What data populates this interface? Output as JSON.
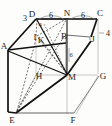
{
  "figure": {
    "kind": "3d-rectangular-prism-geometry-diagram",
    "stroke_colors": {
      "bold": "#111111",
      "thin": "#5a5a5a",
      "light": "#a8a8a8",
      "dashed": "#3a3a3a"
    },
    "background": "#fdfdfb"
  },
  "vertices": [
    {
      "name": "A",
      "label": "A",
      "x": 6,
      "y": 46
    },
    {
      "name": "B",
      "label": "B",
      "x": 65,
      "y": 37
    },
    {
      "name": "C",
      "label": "C",
      "x": 98,
      "y": 15
    },
    {
      "name": "D",
      "label": "D",
      "x": 35,
      "y": 15
    },
    {
      "name": "E",
      "label": "E",
      "x": 14,
      "y": 116
    },
    {
      "name": "F",
      "label": "F",
      "x": 74,
      "y": 116
    },
    {
      "name": "G",
      "label": "G",
      "x": 101,
      "y": 76
    },
    {
      "name": "H",
      "label": "H",
      "x": 38,
      "y": 77
    },
    {
      "name": "I",
      "label": "I",
      "x": 36,
      "y": 38
    },
    {
      "name": "J",
      "label": "J",
      "x": 92,
      "y": 39
    },
    {
      "name": "K",
      "label": "K",
      "x": 40,
      "y": 41
    },
    {
      "name": "M",
      "label": "M",
      "x": 70,
      "y": 77
    },
    {
      "name": "N",
      "label": "N",
      "x": 67,
      "y": 15
    }
  ],
  "dimensions": [
    {
      "name": "dim-3-left-of-D",
      "label": "3",
      "x": 26,
      "y": 18
    },
    {
      "name": "dim-6-D-to-N",
      "label": "6",
      "x": 51,
      "y": 15
    },
    {
      "name": "dim-6-N-to-C",
      "label": "6",
      "x": 83,
      "y": 15
    },
    {
      "name": "dim-4-below-D",
      "label": "4",
      "x": 40,
      "y": 26
    },
    {
      "name": "dim-4-right-of-J",
      "label": "4",
      "x": 107,
      "y": 33
    },
    {
      "name": "dim-6-vertical-BM",
      "label": "6",
      "x": 71,
      "y": 55
    }
  ],
  "edges": {
    "bold": [
      {
        "name": "edge-A-D",
        "from": "A",
        "to": "D"
      },
      {
        "name": "edge-D-N",
        "from": "D",
        "to": "N"
      },
      {
        "name": "edge-N-C",
        "from": "N",
        "to": "C"
      },
      {
        "name": "edge-C-J",
        "from": "C",
        "to": "J"
      },
      {
        "name": "edge-A-E",
        "from": "A",
        "to": "E"
      },
      {
        "name": "edge-E-M",
        "from": "E",
        "to": "M"
      },
      {
        "name": "edge-M-J",
        "from": "M",
        "to": "J"
      },
      {
        "name": "edge-A-M",
        "from": "A",
        "to": "M"
      },
      {
        "name": "edge-D-M",
        "from": "D",
        "to": "M"
      },
      {
        "name": "edge-N-M",
        "from": "N",
        "to": "M"
      },
      {
        "name": "edge-A-B",
        "from": "A",
        "to": "B"
      }
    ],
    "thin": [
      {
        "name": "edge-E-F",
        "from": "E",
        "to": "F"
      },
      {
        "name": "edge-F-G",
        "from": "F",
        "to": "G"
      },
      {
        "name": "edge-C-G",
        "from": "C",
        "to": "G"
      },
      {
        "name": "edge-B-J",
        "from": "B",
        "to": "J"
      },
      {
        "name": "edge-B-M",
        "from": "B",
        "to": "M"
      }
    ],
    "light": [
      {
        "name": "edge-H-E",
        "from": "H",
        "to": "E"
      },
      {
        "name": "edge-H-M",
        "from": "H",
        "to": "M"
      },
      {
        "name": "edge-H-I",
        "from": "H",
        "to": "I"
      },
      {
        "name": "edge-M-G",
        "from": "M",
        "to": "G"
      },
      {
        "name": "edge-M-F",
        "from": "M",
        "to": "F"
      }
    ],
    "dashed": [
      {
        "name": "edge-I-D",
        "from": "I",
        "to": "D"
      },
      {
        "name": "edge-I-N",
        "from": "I",
        "to": "N"
      },
      {
        "name": "edge-I-M",
        "from": "I",
        "to": "M"
      },
      {
        "name": "edge-I-E",
        "from": "I",
        "to": "E"
      },
      {
        "name": "edge-E-N",
        "from": "E",
        "to": "N"
      },
      {
        "name": "edge-E-B",
        "from": "E",
        "to": "B"
      },
      {
        "name": "edge-K-M",
        "from": "K",
        "to": "M"
      }
    ]
  }
}
